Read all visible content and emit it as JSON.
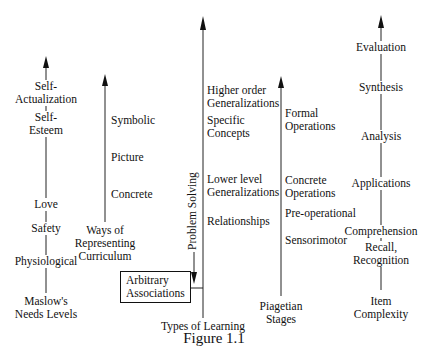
{
  "figure": {
    "caption": "Figure 1.1"
  },
  "columns": {
    "maslow": {
      "title": "Maslow's\nNeeds Levels",
      "title_lines": [
        "Maslow's",
        "Needs Levels"
      ],
      "levels": [
        {
          "lines": [
            "Self-",
            "Actualization"
          ]
        },
        {
          "lines": [
            "Self-",
            "Esteem"
          ]
        },
        {
          "lines": [
            "Love"
          ]
        },
        {
          "lines": [
            "Safety"
          ]
        },
        {
          "lines": [
            "Physiological"
          ]
        }
      ]
    },
    "curriculum": {
      "title_lines": [
        "Ways of",
        "Representing",
        "Curriculum"
      ],
      "levels": [
        {
          "lines": [
            "Symbolic"
          ]
        },
        {
          "lines": [
            "Picture"
          ]
        },
        {
          "lines": [
            "Concrete"
          ]
        }
      ]
    },
    "learning": {
      "title": "Types of Learning",
      "levels": [
        {
          "lines": [
            "Higher order",
            "Generalizations"
          ]
        },
        {
          "lines": [
            "Specific",
            "Concepts"
          ]
        },
        {
          "lines": [
            "Lower level",
            "Generalizations"
          ]
        },
        {
          "lines": [
            "Relationships"
          ]
        }
      ],
      "side_arrow_label": "Problem Solving",
      "box_lines": [
        "Arbitrary",
        "Associations"
      ]
    },
    "piaget": {
      "title_lines": [
        "Piagetian",
        "Stages"
      ],
      "levels": [
        {
          "lines": [
            "Formal",
            "Operations"
          ]
        },
        {
          "lines": [
            "Concrete",
            "Operations"
          ]
        },
        {
          "lines": [
            "Pre-operational"
          ]
        },
        {
          "lines": [
            "Sensorimotor"
          ]
        }
      ]
    },
    "complexity": {
      "title_lines": [
        "Item",
        "Complexity"
      ],
      "levels": [
        {
          "lines": [
            "Evaluation"
          ]
        },
        {
          "lines": [
            "Synthesis"
          ]
        },
        {
          "lines": [
            "Analysis"
          ]
        },
        {
          "lines": [
            "Applications"
          ]
        },
        {
          "lines": [
            "Comprehension"
          ]
        },
        {
          "lines": [
            "Recall,",
            "Recognition"
          ]
        }
      ]
    }
  }
}
